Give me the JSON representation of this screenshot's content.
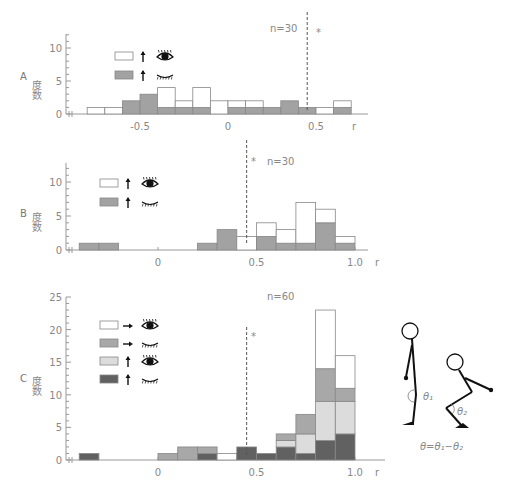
{
  "chart_data": [
    {
      "panel": "A",
      "type": "bar",
      "stacked": true,
      "title": "",
      "annotation_n": "n=30",
      "significance_marker": "*",
      "significance_line_x": 0.45,
      "xlabel": "r",
      "ylabel": "度数",
      "ylim": [
        0,
        12
      ],
      "yticks": [
        0,
        5,
        10
      ],
      "xticks": [
        "-0.5",
        "0",
        "0.5"
      ],
      "bin_width": 0.1,
      "bin_starts": [
        -0.8,
        -0.7,
        -0.6,
        -0.5,
        -0.4,
        -0.3,
        -0.2,
        -0.1,
        0.0,
        0.1,
        0.2,
        0.3,
        0.4,
        0.5,
        0.6
      ],
      "series": [
        {
          "name": "↑ eyes open",
          "color": "#a2a2a2",
          "values": [
            0,
            0,
            2,
            3,
            1,
            1,
            1,
            0,
            1,
            1,
            1,
            2,
            1,
            0,
            1
          ]
        },
        {
          "name": "↑ eyes closed",
          "color": "#ffffff",
          "values": [
            1,
            1,
            0,
            0,
            3,
            1,
            3,
            2,
            1,
            1,
            0,
            0,
            0,
            1,
            1
          ]
        }
      ],
      "legend": [
        {
          "swatch": "#ffffff",
          "arrow": "↑",
          "eye": "open"
        },
        {
          "swatch": "#a2a2a2",
          "arrow": "↑",
          "eye": "closed"
        }
      ]
    },
    {
      "panel": "B",
      "type": "bar",
      "stacked": true,
      "annotation_n": "n=30",
      "significance_marker": "*",
      "significance_line_x": 0.45,
      "xlabel": "r",
      "ylabel": "度数",
      "ylim": [
        0,
        12
      ],
      "yticks": [
        0,
        5,
        10
      ],
      "xticks": [
        "0",
        "0.5",
        "1.0"
      ],
      "bin_width": 0.1,
      "bin_starts": [
        -0.4,
        -0.3,
        0.2,
        0.3,
        0.4,
        0.5,
        0.6,
        0.7,
        0.8,
        0.9
      ],
      "series": [
        {
          "name": "↑ eyes closed (gray)",
          "color": "#a2a2a2",
          "values": [
            1,
            1,
            1,
            3,
            0,
            2,
            1,
            1,
            4,
            1
          ]
        },
        {
          "name": "↑ eyes open (white)",
          "color": "#ffffff",
          "values": [
            0,
            0,
            0,
            0,
            2,
            2,
            2,
            6,
            2,
            1
          ]
        }
      ],
      "legend": [
        {
          "swatch": "#ffffff",
          "arrow": "↑",
          "eye": "open"
        },
        {
          "swatch": "#a2a2a2",
          "arrow": "↑",
          "eye": "closed"
        }
      ]
    },
    {
      "panel": "C",
      "type": "bar",
      "stacked": true,
      "annotation_n": "n=60",
      "significance_marker": "*",
      "significance_line_x": 0.45,
      "xlabel": "r",
      "ylabel": "度数",
      "ylim": [
        0,
        25
      ],
      "yticks": [
        0,
        5,
        10,
        15,
        20,
        25
      ],
      "xticks": [
        "0",
        "0.5",
        "1.0"
      ],
      "bin_width": 0.1,
      "bin_starts": [
        -0.4,
        0.0,
        0.1,
        0.2,
        0.3,
        0.4,
        0.5,
        0.6,
        0.7,
        0.8,
        0.9
      ],
      "series": [
        {
          "name": "↑ eyes closed",
          "color": "#616161",
          "values": [
            1,
            0,
            0,
            1,
            0,
            2,
            1,
            2,
            1,
            3,
            4
          ]
        },
        {
          "name": "↑ eyes open",
          "color": "#dcdcdc",
          "values": [
            0,
            0,
            0,
            0,
            0,
            0,
            0,
            1,
            3,
            6,
            5
          ]
        },
        {
          "name": "→ eyes closed",
          "color": "#a8a8a8",
          "values": [
            0,
            1,
            2,
            1,
            0,
            0,
            0,
            1,
            3,
            5,
            2
          ]
        },
        {
          "name": "→ eyes open",
          "color": "#ffffff",
          "values": [
            0,
            0,
            0,
            0,
            1,
            0,
            0,
            0,
            0,
            9,
            5
          ]
        }
      ],
      "legend": [
        {
          "swatch": "#ffffff",
          "arrow": "→",
          "eye": "open"
        },
        {
          "swatch": "#a8a8a8",
          "arrow": "→",
          "eye": "closed"
        },
        {
          "swatch": "#dcdcdc",
          "arrow": "↑",
          "eye": "open"
        },
        {
          "swatch": "#616161",
          "arrow": "↑",
          "eye": "closed"
        }
      ]
    }
  ],
  "labels": {
    "panel_a": "A",
    "panel_b": "B",
    "panel_c": "C",
    "ylabel": "度数",
    "xlabel": "r",
    "n_a": "n=30",
    "n_b": "n=30",
    "n_c": "n=60",
    "star": "*",
    "formula": "θ=θ₁−θ₂",
    "theta1": "θ₁",
    "theta2": "θ₂"
  }
}
